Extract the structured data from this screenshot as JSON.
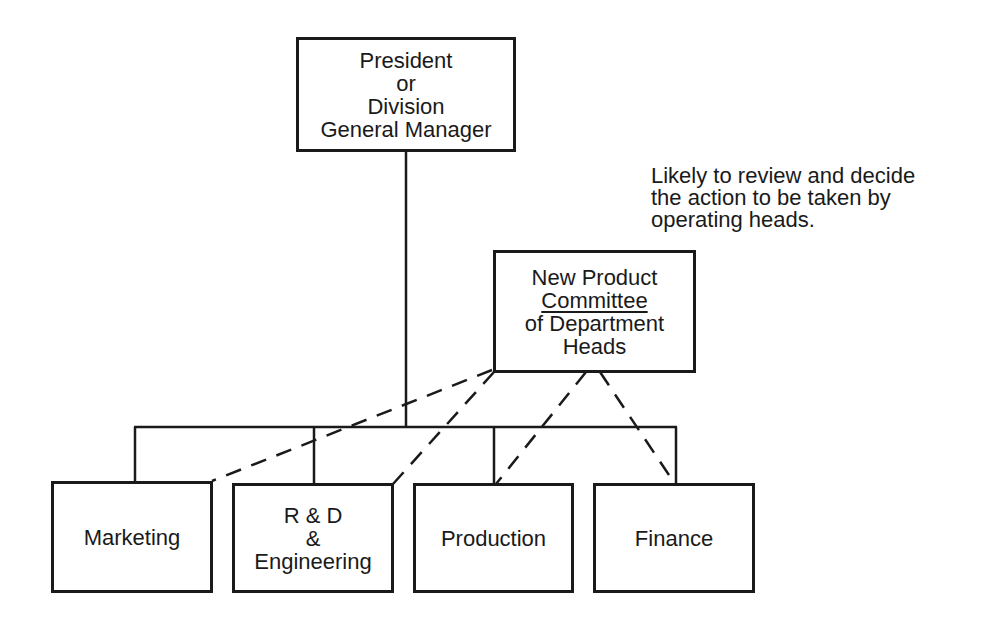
{
  "diagram": {
    "top": {
      "lines": [
        "President",
        "or",
        "Division",
        "General Manager"
      ]
    },
    "committee": {
      "lines": [
        "New Product",
        "Committee",
        "of Department",
        "Heads"
      ]
    },
    "note": {
      "lines": [
        "Likely to review and decide",
        "the action to be taken by",
        "operating heads."
      ]
    },
    "departments": [
      {
        "lines": [
          "Marketing"
        ]
      },
      {
        "lines": [
          "R & D",
          "&",
          "Engineering"
        ]
      },
      {
        "lines": [
          "Production"
        ]
      },
      {
        "lines": [
          "Finance"
        ]
      }
    ]
  }
}
